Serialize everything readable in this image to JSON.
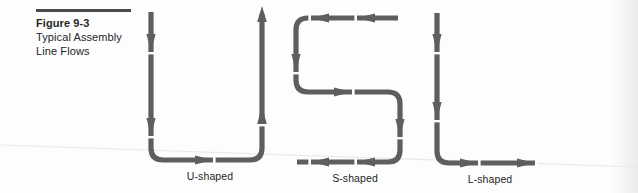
{
  "figure": {
    "number": "Figure 9-3",
    "title_line1": "Typical Assembly",
    "title_line2": "Line Flows"
  },
  "colors": {
    "stroke": "#5e5e5e",
    "stroke_dark": "#4f4f4f",
    "caption_rule": "#4a4a4a",
    "text": "#252525",
    "background": "#fdfdfd",
    "scan_line": "#e8e8e8"
  },
  "diagrams": [
    {
      "id": "u-shaped",
      "label": "U-shaped",
      "description": "Flow enters at top left moving down, turns right across the bottom, then exits upward at top right",
      "directions": [
        "down",
        "right",
        "up"
      ]
    },
    {
      "id": "s-shaped",
      "label": "S-shaped",
      "description": "Flow enters at top right moving left, turns down, runs right, turns down again, then exits left along the bottom",
      "directions": [
        "left",
        "down",
        "right",
        "down",
        "left"
      ]
    },
    {
      "id": "l-shaped",
      "label": "L-shaped",
      "description": "Flow enters at top moving down, then turns and exits to the right along the bottom",
      "directions": [
        "down",
        "right"
      ]
    }
  ]
}
